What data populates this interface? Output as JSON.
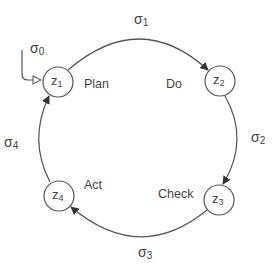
{
  "diagram": {
    "type": "state-cycle",
    "colors": {
      "stroke": "#555555",
      "text": "#444444",
      "background": "#ffffff"
    },
    "nodes": [
      {
        "id": "z1",
        "base": "z",
        "sub": "1",
        "stage": "Plan",
        "cx": 58,
        "cy": 82
      },
      {
        "id": "z2",
        "base": "z",
        "sub": "2",
        "stage": "Do",
        "cx": 220,
        "cy": 81
      },
      {
        "id": "z3",
        "base": "z",
        "sub": "3",
        "stage": "Check",
        "cx": 219,
        "cy": 200
      },
      {
        "id": "z4",
        "base": "z",
        "sub": "4",
        "stage": "Act",
        "cx": 59,
        "cy": 196
      }
    ],
    "edges": [
      {
        "id": "sigma0",
        "base": "σ",
        "sub": "0",
        "from": "start",
        "to": "z1",
        "arrow": "hollow"
      },
      {
        "id": "sigma1",
        "base": "σ",
        "sub": "1",
        "from": "z1",
        "to": "z2",
        "arrow": "filled"
      },
      {
        "id": "sigma2",
        "base": "σ",
        "sub": "2",
        "from": "z2",
        "to": "z3",
        "arrow": "filled"
      },
      {
        "id": "sigma3",
        "base": "σ",
        "sub": "3",
        "from": "z3",
        "to": "z4",
        "arrow": "filled"
      },
      {
        "id": "sigma4",
        "base": "σ",
        "sub": "4",
        "from": "z4",
        "to": "z1",
        "arrow": "filled"
      }
    ]
  }
}
